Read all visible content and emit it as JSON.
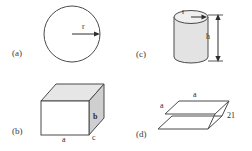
{
  "figure": {
    "stroke_color": "#4a4a4a",
    "fill_color": "#d9d9d9",
    "background": "#ffffff"
  },
  "panels": [
    {
      "id": "a",
      "label": "(a)",
      "shape": "circle",
      "shape_name": "circle-with-radius",
      "dimension_labels": [
        {
          "name": "radius",
          "text": "r"
        }
      ]
    },
    {
      "id": "b",
      "label": "(b)",
      "shape": "rectangular-box",
      "shape_name": "cuboid-with-edges",
      "dimension_labels": [
        {
          "name": "length",
          "text": "a"
        },
        {
          "name": "height",
          "text": "b"
        },
        {
          "name": "depth",
          "text": "c"
        }
      ]
    },
    {
      "id": "c",
      "label": "(c)",
      "shape": "cylinder",
      "shape_name": "cylinder-with-radius-and-height",
      "dimension_labels": [
        {
          "name": "radius",
          "text": "r"
        },
        {
          "name": "height",
          "text": "h"
        }
      ]
    },
    {
      "id": "d",
      "label": "(d)",
      "shape": "stacked-parallelograms",
      "shape_name": "two-parallel-plates",
      "dimension_labels": [
        {
          "name": "top-side",
          "text": "a"
        },
        {
          "name": "left-side",
          "text": "a"
        },
        {
          "name": "separation",
          "text": "21"
        }
      ]
    }
  ]
}
